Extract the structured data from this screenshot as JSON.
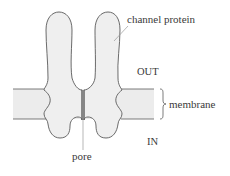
{
  "diagram": {
    "labels": {
      "channel_protein": "channel protein",
      "out": "OUT",
      "membrane": "membrane",
      "in": "IN",
      "pore": "pore"
    },
    "colors": {
      "outline": "#5a5a5a",
      "protein_fill": "#efefef",
      "membrane_fill": "#ececec",
      "leader_line": "#9a9a9a",
      "text": "#3a3a3a"
    }
  }
}
